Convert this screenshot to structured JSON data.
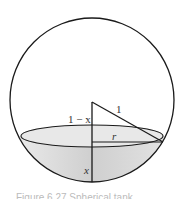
{
  "figure": {
    "labels": {
      "hypotenuse": "1",
      "upper_segment": "1 − x",
      "radius": "r",
      "depth": "x"
    },
    "caption": "Figure 6.27 Spherical tank",
    "colors": {
      "stroke": "#1a1a1a",
      "water_fill": "#d9d9d9",
      "water_surface": "#e6e6e6"
    }
  }
}
